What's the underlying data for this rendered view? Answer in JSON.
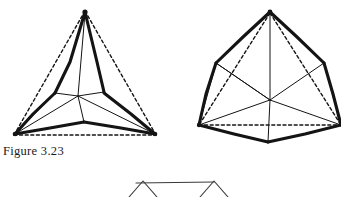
{
  "plate": {
    "caption": "Figure 3.23",
    "background_color": "#ffffff",
    "ink_color": "#141414",
    "width": 341,
    "height": 197
  },
  "figures": {
    "left": {
      "name": "faceted-tetrahedral-solid",
      "description": "Triangular solid with bent thick edges inscribed in a dashed triangle",
      "apex": [
        85,
        11
      ],
      "base_left": [
        14,
        135
      ],
      "base_right": [
        156,
        135
      ],
      "center": [
        78,
        96
      ],
      "mid_left": [
        55,
        93
      ],
      "mid_right": [
        104,
        92
      ],
      "base_mid": [
        84,
        122
      ],
      "dashed_outline": [
        [
          85,
          11
        ],
        [
          14,
          135
        ],
        [
          156,
          135
        ]
      ],
      "thick_stroke_width": 3.1,
      "thin_stroke_width": 1.0,
      "dash_stroke_width": 1.4,
      "dash_pattern": "3,2.6"
    },
    "right": {
      "name": "truncated-hexagonal-solid",
      "description": "Rounded hexagonal solid with six spokes radiating from centre",
      "apex": [
        270,
        11
      ],
      "shoulder_left": [
        216,
        63
      ],
      "shoulder_right": [
        324,
        63
      ],
      "base_left": [
        199,
        125
      ],
      "base_right": [
        341,
        125
      ],
      "base_bottom": [
        268,
        142
      ],
      "center": [
        270,
        100
      ],
      "thick_stroke_width": 3.1,
      "thin_stroke_width": 1.0,
      "dash_stroke_width": 1.4,
      "dash_pattern": "3,2.6"
    },
    "bottom_partial": {
      "name": "cropped-peaks-figure",
      "description": "Partially visible next figure: horizontal bar with two small peaks, cropped by the page edge",
      "bar": [
        [
          136,
          183
        ],
        [
          214,
          182
        ]
      ],
      "peak_left": [
        [
          129,
          197
        ],
        [
          143,
          181
        ],
        [
          157,
          197
        ]
      ],
      "peak_right": [
        [
          200,
          197
        ],
        [
          214,
          181
        ],
        [
          228,
          197
        ]
      ],
      "stroke_width": 1.1
    }
  }
}
